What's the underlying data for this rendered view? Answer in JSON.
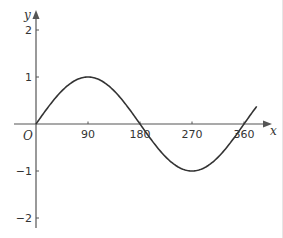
{
  "chart_data": {
    "type": "line",
    "title": "",
    "function": "y = sin x",
    "xlabel": "x",
    "ylabel": "y",
    "origin_label": "O",
    "x_ticks": [
      90,
      180,
      270,
      360
    ],
    "x_tick_labels": [
      "90",
      "180",
      "270",
      "360"
    ],
    "y_ticks": [
      -2,
      -1,
      1,
      2
    ],
    "y_tick_labels": [
      "−2",
      "−1",
      "1",
      "2"
    ],
    "xlim": [
      0,
      382
    ],
    "ylim": [
      -2.2,
      2.3
    ],
    "grid": false,
    "legend": null,
    "series": [
      {
        "name": "sin x",
        "x": [
          0,
          30,
          60,
          90,
          120,
          150,
          180,
          210,
          240,
          270,
          300,
          330,
          360,
          382
        ],
        "values": [
          0,
          0.5,
          0.866,
          1,
          0.866,
          0.5,
          0,
          -0.5,
          -0.866,
          -1,
          -0.866,
          -0.5,
          0,
          0.37
        ]
      }
    ],
    "colors": {
      "axis": "#555555",
      "curve": "#333333"
    }
  }
}
